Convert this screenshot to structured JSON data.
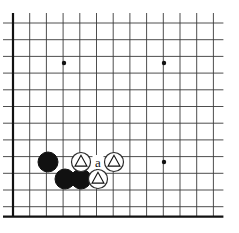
{
  "diagram": {
    "kind": "go-board-corner-diagram",
    "board": {
      "width": 239,
      "height": 233,
      "grid_origin_x": 13,
      "grid_origin_y": 23,
      "grid_spacing": 16.7,
      "columns": 13,
      "rows": 12,
      "edge_left": true,
      "edge_bottom": true,
      "line_color": "#3a3a3a",
      "edge_color": "#111111",
      "background_color": "#ffffff"
    },
    "star_points": [
      {
        "name": "star-point-upper-left",
        "cx": 64,
        "cy": 63
      },
      {
        "name": "star-point-upper-right",
        "cx": 164,
        "cy": 63
      },
      {
        "name": "star-point-lower-right",
        "cx": 164,
        "cy": 162
      }
    ],
    "stones": [
      {
        "id": "black-stone-1",
        "color": "black",
        "cx": 48,
        "cy": 162,
        "r": 10,
        "mark": "none"
      },
      {
        "id": "black-stone-2",
        "color": "black",
        "cx": 65,
        "cy": 179,
        "r": 10,
        "mark": "none"
      },
      {
        "id": "black-stone-3",
        "color": "black",
        "cx": 81,
        "cy": 179,
        "r": 10,
        "mark": "none"
      },
      {
        "id": "white-stone-1",
        "color": "white",
        "cx": 81,
        "cy": 162,
        "r": 9.5,
        "mark": "triangle"
      },
      {
        "id": "white-stone-2",
        "color": "white",
        "cx": 114,
        "cy": 162,
        "r": 9.5,
        "mark": "triangle"
      },
      {
        "id": "white-stone-3",
        "color": "white",
        "cx": 98,
        "cy": 179,
        "r": 9.5,
        "mark": "triangle"
      }
    ],
    "point_labels": [
      {
        "id": "point-label-a",
        "text": "a",
        "cx": 98,
        "cy": 162
      }
    ],
    "colors": {
      "black_stone": "#111111",
      "white_stone": "#ffffff",
      "white_stone_outline": "#2a2a2a",
      "triangle_mark": "#111111",
      "grid_line": "#3a3a3a",
      "board_edge": "#111111",
      "label_text": "#111111"
    }
  }
}
